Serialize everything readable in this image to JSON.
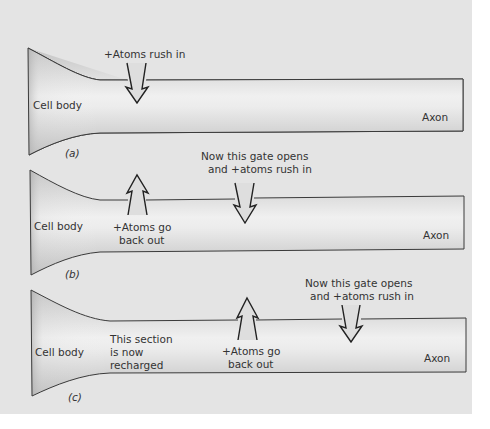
{
  "figure": {
    "background_color": "#e4e4e4",
    "tube_center_color": "#f2f2f2",
    "tube_edge_color": "#b8b8b8",
    "panels": [
      {
        "caption": "(a)",
        "cell_body_label": "Cell body",
        "axon_label": "Axon",
        "annotations": [
          {
            "kind": "arrow-in",
            "text_lines": [
              "+Atoms rush in"
            ]
          }
        ]
      },
      {
        "caption": "(b)",
        "cell_body_label": "Cell body",
        "axon_label": "Axon",
        "annotations": [
          {
            "kind": "arrow-out",
            "text_lines": [
              "+Atoms go",
              "back out"
            ]
          },
          {
            "kind": "arrow-in",
            "text_lines": [
              "Now this gate opens",
              "and +atoms rush in"
            ]
          }
        ]
      },
      {
        "caption": "(c)",
        "cell_body_label": "Cell body",
        "axon_label": "Axon",
        "note_lines": [
          "This section",
          "is now",
          "recharged"
        ],
        "annotations": [
          {
            "kind": "arrow-out",
            "text_lines": [
              "+Atoms go",
              "back out"
            ]
          },
          {
            "kind": "arrow-in",
            "text_lines": [
              "Now this gate opens",
              "and +atoms rush in"
            ]
          }
        ]
      }
    ]
  }
}
